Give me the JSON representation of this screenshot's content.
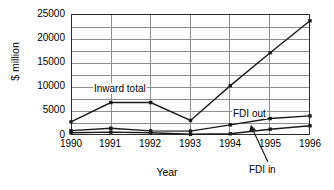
{
  "chart_data": {
    "type": "line",
    "title": "",
    "xlabel": "Year",
    "ylabel": "$ million",
    "x": [
      "1990",
      "1991",
      "1992",
      "1993",
      "1994",
      "1995",
      "1996"
    ],
    "xlim": [
      1990,
      1996
    ],
    "ylim": [
      0,
      25000
    ],
    "yticks": [
      0,
      5000,
      10000,
      15000,
      20000,
      25000
    ],
    "ytick_labels": [
      "0",
      "5000",
      "10000",
      "15000",
      "20000",
      "25000"
    ],
    "minor_y_step": 2500,
    "grid": "both",
    "legend_position": "inline-annotations",
    "series": [
      {
        "name": "Inward total",
        "values": [
          2700,
          6700,
          6700,
          3000,
          10200,
          17000,
          23600
        ],
        "marker": "square",
        "color": "#1a1a1a"
      },
      {
        "name": "FDI out",
        "values": [
          900,
          1400,
          850,
          800,
          2100,
          3400,
          3950
        ],
        "marker": "square",
        "color": "#1a1a1a"
      },
      {
        "name": "FDI in",
        "values": [
          450,
          600,
          450,
          150,
          250,
          1200,
          1900
        ],
        "marker": "square",
        "color": "#1a1a1a"
      }
    ],
    "annotations": [
      {
        "text": "Inward total",
        "series": "Inward total"
      },
      {
        "text": "FDI out",
        "series": "FDI out"
      },
      {
        "text": "FDI in",
        "series": "FDI in",
        "leader": true
      }
    ]
  },
  "axis": {
    "y_title": "$ million",
    "x_title": "Year",
    "y_ticks": [
      "25000",
      "20000",
      "15000",
      "10000",
      "5000",
      "0"
    ],
    "x_ticks": [
      "1990",
      "1991",
      "1992",
      "1993",
      "1994",
      "1995",
      "1996"
    ]
  },
  "labels": {
    "inward_total": "Inward total",
    "fdi_out": "FDI out",
    "fdi_in": "FDI in"
  },
  "colors": {
    "line": "#1a1a1a",
    "grid": "#8d8d8d",
    "frame": "#2b2b2b",
    "background": "#ffffff"
  }
}
